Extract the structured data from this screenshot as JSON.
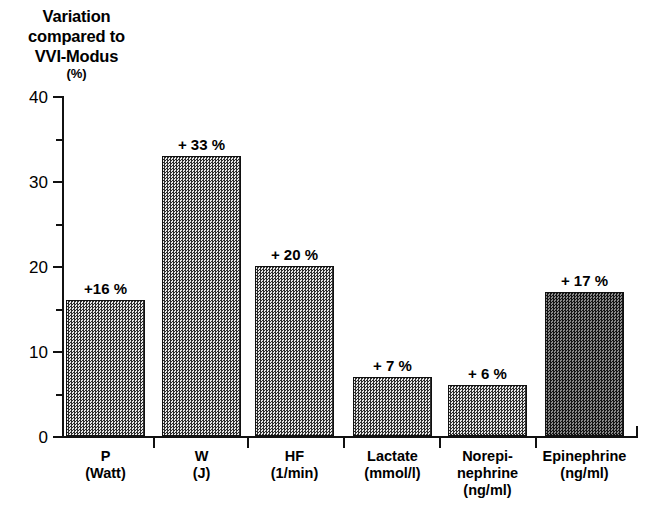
{
  "title": {
    "lines": [
      "Variation",
      "compared to",
      "VVI-Modus"
    ],
    "unit": "(%)"
  },
  "chart_data": {
    "type": "bar",
    "title": "Variation compared to VVI-Modus (%)",
    "xlabel": "",
    "ylabel": "(%)",
    "ylim": [
      0,
      40
    ],
    "yticks": [
      0,
      10,
      20,
      30,
      40
    ],
    "ytick_labels": [
      "0",
      "10",
      "20",
      "30",
      "40"
    ],
    "yminor_ticks": [
      5,
      15,
      25,
      35
    ],
    "grid": false,
    "legend": false,
    "categories": [
      "P (Watt)",
      "W (J)",
      "HF (1/min)",
      "Lactate (mmol/l)",
      "Norepinephrine (ng/ml)",
      "Epinephrine (ng/ml)"
    ],
    "category_label_lines": [
      [
        "P",
        "(Watt)"
      ],
      [
        "W",
        "(J)"
      ],
      [
        "HF",
        "(1/min)"
      ],
      [
        "Lactate",
        "(mmol/l)"
      ],
      [
        "Norepi-",
        "nephrine",
        "(ng/ml)"
      ],
      [
        "Epinephrine",
        "(ng/ml)"
      ]
    ],
    "values": [
      16,
      33,
      20,
      7,
      6,
      17
    ],
    "data_labels": [
      "+16 %",
      "+ 33 %",
      "+ 20 %",
      "+ 7 %",
      "+ 6 %",
      "+ 17 %"
    ],
    "bar_fill": "#8c8c8c",
    "bar_fill_dark": "#4a4a4a",
    "bar_edge": "#111111",
    "dark_bar_index": 5
  }
}
